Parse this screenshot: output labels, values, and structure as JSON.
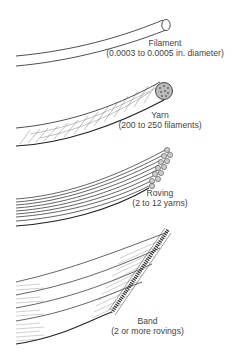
{
  "diagram": {
    "items": [
      {
        "name": "Filament",
        "detail": "(0.0003 to 0.0005 in. diameter)"
      },
      {
        "name": "Yarn",
        "detail": "(200 to 250 filaments)"
      },
      {
        "name": "Roving",
        "detail": "(2 to 12 yarns)"
      },
      {
        "name": "Band",
        "detail": "(2 or more rovings)"
      }
    ],
    "colors": {
      "line": "#222222",
      "text": "#444444",
      "background": "#ffffff"
    }
  }
}
